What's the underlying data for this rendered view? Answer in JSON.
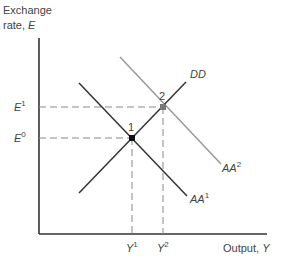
{
  "diagram": {
    "y_axis_label_line1": "Exchange",
    "y_axis_label_line2_prefix": "rate, ",
    "y_axis_label_var": "E",
    "x_axis_label_prefix": "Output, ",
    "x_axis_label_var": "Y",
    "curves": [
      {
        "name": "DD",
        "label": "DD",
        "sup": "",
        "color": "#333333"
      },
      {
        "name": "AA1",
        "label": "AA",
        "sup": "1",
        "color": "#333333"
      },
      {
        "name": "AA2",
        "label": "AA",
        "sup": "2",
        "color": "#888888"
      }
    ],
    "points": [
      {
        "label": "1",
        "color": "#111111"
      },
      {
        "label": "2",
        "color": "#777777"
      }
    ],
    "y_ticks": [
      {
        "var": "E",
        "sup": "1"
      },
      {
        "var": "E",
        "sup": "0"
      }
    ],
    "x_ticks": [
      {
        "var": "Y",
        "sup": "1"
      },
      {
        "var": "Y",
        "sup": "2"
      }
    ]
  }
}
